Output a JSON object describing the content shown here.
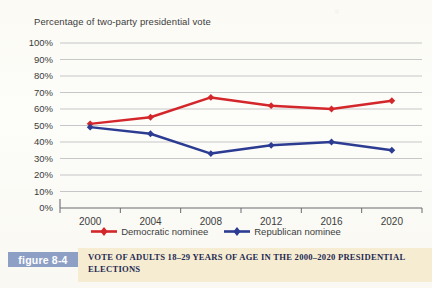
{
  "chart_data": {
    "type": "line",
    "title": "Percentage of two-party presidential vote",
    "xlabel": "",
    "ylabel": "",
    "categories": [
      "2000",
      "2004",
      "2008",
      "2012",
      "2016",
      "2020"
    ],
    "x": [
      2000,
      2004,
      2008,
      2012,
      2016,
      2020
    ],
    "ylim": [
      0,
      100
    ],
    "ytick_labels": [
      "0%",
      "10%",
      "20%",
      "30%",
      "40%",
      "50%",
      "60%",
      "70%",
      "80%",
      "90%",
      "100%"
    ],
    "ytick_values": [
      0,
      10,
      20,
      30,
      40,
      50,
      60,
      70,
      80,
      90,
      100
    ],
    "grid": true,
    "legend_position": "bottom",
    "series": [
      {
        "name": "Democratic nominee",
        "color": "#d4272b",
        "values": [
          51,
          55,
          67,
          62,
          60,
          65
        ]
      },
      {
        "name": "Republican nominee",
        "color": "#2c3c92",
        "values": [
          49,
          45,
          33,
          38,
          40,
          35
        ]
      }
    ]
  },
  "figure": {
    "badge": "figure 8-4",
    "caption": "VOTE OF ADULTS 18–29 YEARS OF AGE IN THE 2000–2020 PRESIDENTIAL ELECTIONS"
  },
  "colors": {
    "democratic": "#d4272b",
    "republican": "#2c3c92",
    "badge_bg": "#8e9fc6",
    "caption_bg": "#f6ecd2",
    "caption_text": "#1e2a52",
    "grid": "#b9b9bd",
    "axis": "#6b6b70",
    "text": "#3c3c3c",
    "page_bg": "#fdfcf7"
  }
}
